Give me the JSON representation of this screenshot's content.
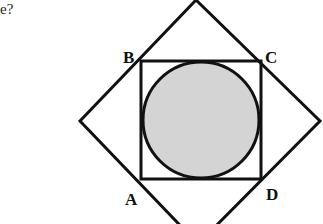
{
  "question_fragment": "e?",
  "figure": {
    "labels": {
      "B": "B",
      "C": "C",
      "A": "A",
      "D": "D"
    },
    "outer_shape": "rotated square (diamond)",
    "inner_shape": "square ABCD",
    "circle": "inscribed shaded circle",
    "colors": {
      "stroke": "#111111",
      "circle_fill": "#d4d4d4",
      "background": "#ffffff"
    }
  }
}
